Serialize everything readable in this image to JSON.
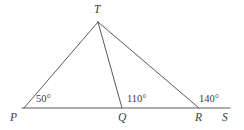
{
  "figure": {
    "type": "geometry-diagram",
    "width": 244,
    "height": 130,
    "background_color": "#ffffff",
    "stroke_color": "#5a5a5a",
    "text_color": "#3a3a3a",
    "stroke_width": 1
  },
  "points": [
    {
      "id": "P",
      "label": "P",
      "x": 24,
      "y": 108,
      "label_x": 10,
      "label_y": 112
    },
    {
      "id": "Q",
      "label": "Q",
      "x": 122,
      "y": 108,
      "label_x": 118,
      "label_y": 112
    },
    {
      "id": "R",
      "label": "R",
      "x": 199,
      "y": 108,
      "label_x": 195,
      "label_y": 112
    },
    {
      "id": "S",
      "label": "S",
      "x": 230,
      "y": 108,
      "label_x": 222,
      "label_y": 112
    },
    {
      "id": "T",
      "label": "T",
      "x": 98,
      "y": 22,
      "label_x": 94,
      "label_y": 4
    }
  ],
  "segments": [
    {
      "id": "base-PS",
      "from": "P",
      "to": "S",
      "x1": 22,
      "y1": 108,
      "x2": 230,
      "y2": 108
    },
    {
      "id": "side-PT",
      "from": "P",
      "to": "T",
      "x1": 24,
      "y1": 108,
      "x2": 98,
      "y2": 22
    },
    {
      "id": "cevian-TQ",
      "from": "T",
      "to": "Q",
      "x1": 98,
      "y1": 22,
      "x2": 122,
      "y2": 108
    },
    {
      "id": "side-TR",
      "from": "T",
      "to": "R",
      "x1": 98,
      "y1": 22,
      "x2": 199,
      "y2": 108
    }
  ],
  "angles": [
    {
      "id": "angle-at-P",
      "vertex": "P",
      "value": 50,
      "text": "50°",
      "x": 36,
      "y": 94
    },
    {
      "id": "angle-at-Q",
      "vertex": "Q",
      "value": 110,
      "text": "110°",
      "x": 127,
      "y": 94
    },
    {
      "id": "angle-at-R",
      "vertex": "R",
      "value": 140,
      "text": "140°",
      "x": 199,
      "y": 94
    }
  ]
}
